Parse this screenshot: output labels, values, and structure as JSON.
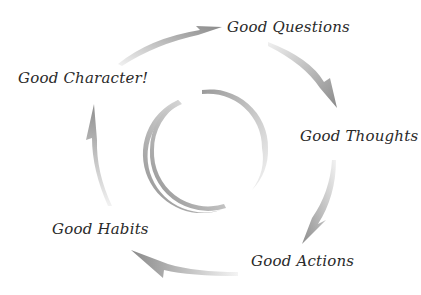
{
  "diagram": {
    "type": "cycle",
    "center_ring": "hollow circle",
    "colors": {
      "arrow": "#8c8c8c",
      "arrow_light": "#e6e6e6",
      "text": "#2a2a2a",
      "background": "#ffffff"
    },
    "stages": [
      {
        "label": "Good Questions"
      },
      {
        "label": "Good Thoughts"
      },
      {
        "label": "Good Actions"
      },
      {
        "label": "Good Habits"
      },
      {
        "label": "Good Character!"
      }
    ]
  }
}
